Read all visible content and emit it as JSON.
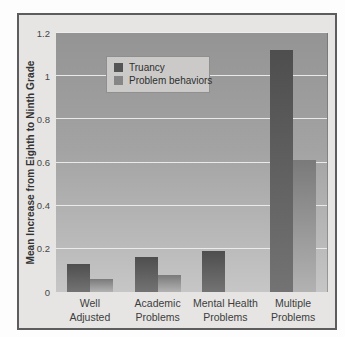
{
  "figure": {
    "frame_border_color": "#5d5d5d",
    "frame_fill_color": "#e6e5e3",
    "plot_bg_top": "#949494",
    "plot_bg_bottom": "#c6c6c6",
    "gridline_color": "#eeedeb"
  },
  "chart_data": {
    "type": "bar",
    "title": "",
    "xlabel": "",
    "ylabel": "Mean Increase from Eighth to Ninth Grade",
    "categories": [
      [
        "Well",
        "Adjusted"
      ],
      [
        "Academic",
        "Problems"
      ],
      [
        "Mental Health",
        "Problems"
      ],
      [
        "Multiple",
        "Problems"
      ]
    ],
    "series": [
      {
        "name": "Truancy",
        "values": [
          0.13,
          0.16,
          0.19,
          1.12
        ],
        "color_top": "#4e4e4e",
        "color_bottom": "#737373",
        "swatch_color": "#555555"
      },
      {
        "name": "Problem behaviors",
        "values": [
          0.06,
          0.08,
          0,
          0.61
        ],
        "color_top": "#7a7a7a",
        "color_bottom": "#b2b2b2",
        "swatch_color": "#868686"
      }
    ],
    "ylim": [
      0,
      1.2
    ],
    "yticks": [
      0,
      0.2,
      0.4,
      0.6,
      0.8,
      1,
      1.2
    ],
    "ytick_labels": [
      "0",
      "0.2",
      "0.4",
      "0.6",
      "0.8",
      "1",
      "1.2"
    ],
    "grid": true,
    "legend_position": "top-left"
  }
}
